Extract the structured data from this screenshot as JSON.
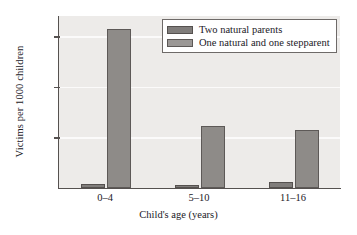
{
  "chart_data": {
    "type": "bar",
    "title": "",
    "xlabel": "Child's age (years)",
    "ylabel": "Victims per 1000 children",
    "categories": [
      "0–4",
      "5–10",
      "11–16"
    ],
    "series": [
      {
        "name": "Two natural parents",
        "color": "#807d7b",
        "values": [
          0.3,
          0.2,
          0.5
        ]
      },
      {
        "name": "One natural and one stepparent",
        "color": "#9b9896",
        "values": [
          12.6,
          4.9,
          4.6
        ]
      }
    ],
    "yticks": [
      4,
      8,
      12
    ],
    "ytick_labels": [
      "4",
      "8",
      "12"
    ],
    "ylim": [
      0,
      13.6
    ],
    "grid": true,
    "legend_position": "top-right",
    "panel_color": "#edebe9",
    "gridline_color": "#fbfafa",
    "axis_color": "#55514f"
  }
}
